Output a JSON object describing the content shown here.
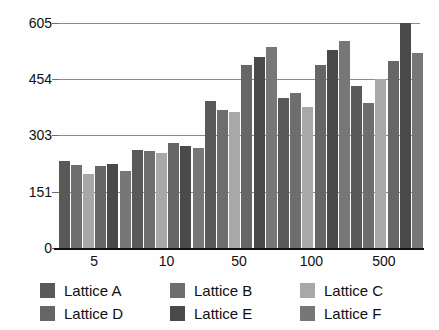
{
  "chart_data": {
    "type": "bar",
    "title": "",
    "xlabel": "",
    "ylabel": "",
    "categories": [
      "5",
      "10",
      "50",
      "100",
      "500"
    ],
    "yticks": [
      0,
      151,
      303,
      454,
      605
    ],
    "ylim": [
      0,
      605
    ],
    "grid": true,
    "legend_position": "bottom",
    "series": [
      {
        "name": "Lattice A",
        "color": "#595959",
        "values": [
          234,
          263,
          396,
          403,
          436
        ]
      },
      {
        "name": "Lattice B",
        "color": "#6e6e6e",
        "values": [
          222,
          262,
          372,
          418,
          391
        ]
      },
      {
        "name": "Lattice C",
        "color": "#a8a8a8",
        "values": [
          199,
          256,
          367,
          379,
          454
        ]
      },
      {
        "name": "Lattice D",
        "color": "#666666",
        "values": [
          220,
          283,
          492,
          492,
          504
        ]
      },
      {
        "name": "Lattice E",
        "color": "#4a4a4a",
        "values": [
          226,
          273,
          514,
          532,
          605
        ]
      },
      {
        "name": "Lattice F",
        "color": "#777777",
        "values": [
          206,
          270,
          541,
          556,
          524
        ]
      }
    ]
  },
  "legend": {
    "items": [
      {
        "label": "Lattice A",
        "color": "#595959"
      },
      {
        "label": "Lattice B",
        "color": "#6e6e6e"
      },
      {
        "label": "Lattice C",
        "color": "#a8a8a8"
      },
      {
        "label": "Lattice D",
        "color": "#666666"
      },
      {
        "label": "Lattice E",
        "color": "#4a4a4a"
      },
      {
        "label": "Lattice F",
        "color": "#777777"
      }
    ]
  }
}
